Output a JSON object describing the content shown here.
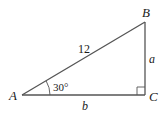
{
  "diagram": {
    "type": "right-triangle",
    "vertices": {
      "A": {
        "label": "A"
      },
      "B": {
        "label": "B"
      },
      "C": {
        "label": "C"
      }
    },
    "sides": {
      "hypotenuse": {
        "label": "12"
      },
      "opposite": {
        "label": "a"
      },
      "adjacent": {
        "label": "b"
      }
    },
    "angle_A": {
      "label": "30°"
    },
    "right_angle_at": "C",
    "colors": {
      "stroke": "#555555",
      "text": "#1a1a1a"
    }
  }
}
